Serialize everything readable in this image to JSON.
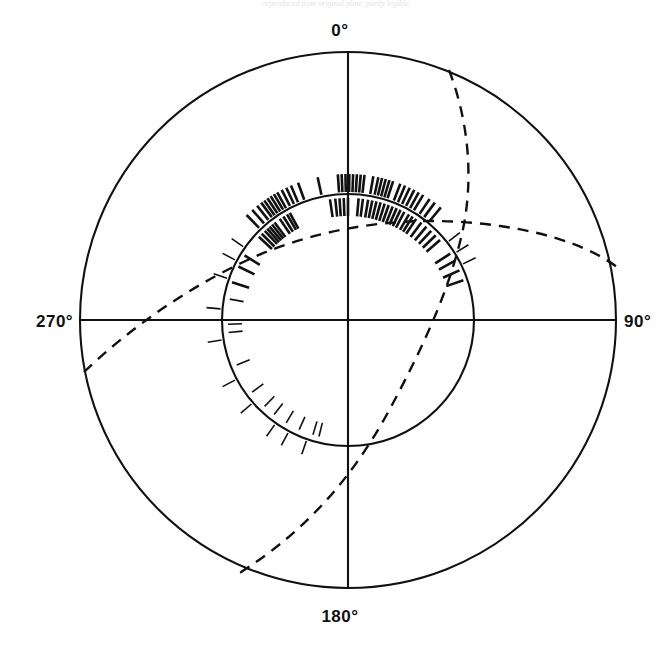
{
  "figure": {
    "title_faint": "reproduced from original plate, partly legible",
    "background_color": "#ffffff",
    "line_color": "#111111",
    "width": 672,
    "height": 649
  },
  "chart_data": {
    "type": "scatter",
    "plot_kind": "polar-azimuth-rose",
    "title": "",
    "xlabel": "",
    "ylabel": "",
    "grid": false,
    "legend": null,
    "center": {
      "x": 348,
      "y": 320
    },
    "radii": {
      "outer": 268,
      "inner": 126
    },
    "axis_tick_labels": [
      "0°",
      "90°",
      "180°",
      "270°"
    ],
    "axis_tick_angles_deg": [
      0,
      90,
      180,
      270
    ],
    "axis_label_positions": {
      "deg0": {
        "x": 340,
        "y": 36,
        "anchor": "middle"
      },
      "deg90": {
        "x": 624,
        "y": 327,
        "anchor": "start"
      },
      "deg180": {
        "x": 340,
        "y": 622,
        "anchor": "middle"
      },
      "deg270": {
        "x": 36,
        "y": 327,
        "anchor": "start"
      }
    },
    "axis_lines": [
      {
        "name": "vertical-axis",
        "x1": 348,
        "y1": 52,
        "x2": 348,
        "y2": 588
      },
      {
        "name": "horizontal-axis",
        "x1": 80,
        "y1": 320,
        "x2": 616,
        "y2": 320
      }
    ],
    "dashed_curves": [
      {
        "name": "great-circle-a",
        "description": "dashed great circle entering at upper right of outer circle and exiting at lower left",
        "path": "M 449,70 C 470,125 474,185 461,238 C 448,292 424,345 392,405 C 360,465 316,525 238,574",
        "dash": "11 8"
      },
      {
        "name": "great-circle-b",
        "description": "dashed great circle entering at left of outer circle and exiting at right",
        "path": "M 84,372 C 128,330 186,288 252,258 C 330,223 420,214 500,226 C 556,234 594,250 617,267",
        "dash": "11 8"
      }
    ],
    "tick_marks": {
      "description": "radial tick marks (data readings) drawn just outside and just inside the inner circle, clustered near 0 degrees",
      "outer_band": {
        "r_start": 128,
        "r_end": 146,
        "angles_deg": [
          -44.0,
          -41.0,
          -38.5,
          -36.5,
          -35.0,
          -33.5,
          -32.0,
          -30.5,
          -29.0,
          -27.0,
          -25.0,
          -23.0,
          -20.0,
          -12.0,
          -4.0,
          -2.5,
          -1.0,
          0.5,
          2.0,
          3.5,
          5.0,
          6.5,
          10.0,
          12.0,
          13.5,
          15.0,
          16.5,
          18.0,
          21.0,
          23.0,
          25.0,
          27.0,
          29.0,
          31.0,
          34.0,
          36.5,
          39.5
        ]
      },
      "inner_band": {
        "r_start": 104,
        "r_end": 122,
        "angles_deg": [
          -47.0,
          -45.0,
          -43.0,
          -41.5,
          -40.0,
          -38.5,
          -37.0,
          -34.0,
          -32.0,
          -30.0,
          -28.5,
          -8.5,
          -6.0,
          -4.0,
          -2.0,
          0.0,
          5.0,
          7.0,
          9.5,
          11.5,
          13.5,
          15.5,
          17.5,
          19.5,
          21.5,
          23.5,
          25.5,
          27.5,
          30.0,
          32.0,
          34.0,
          37.0,
          40.0,
          43.0,
          46.0,
          49.0,
          -58.0,
          -64.0,
          -72.0,
          57.0,
          61.0,
          66.0,
          71.0
        ]
      },
      "sparse_outer": {
        "r_start": 128,
        "r_end": 142,
        "angles_deg": [
          -55.0,
          -62.0,
          -71.0,
          -85.0,
          -99.0,
          -118.0,
          -131.0,
          -145.0,
          -152.0,
          -161.0,
          52.0,
          58.0,
          64.0
        ]
      },
      "sparse_inner": {
        "r_start": 106,
        "r_end": 120,
        "angles_deg": [
          -80.0,
          -92.0,
          -96.0,
          -112.0,
          -127.0,
          -136.0,
          -142.0,
          -149.0,
          -156.0,
          -163.0,
          -166.0
        ]
      }
    }
  },
  "labels": {
    "deg0": "0°",
    "deg90": "90°",
    "deg180": "180°",
    "deg270": "270°"
  }
}
